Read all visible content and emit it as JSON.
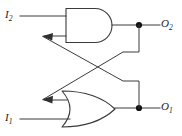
{
  "figure": {
    "width": 182,
    "height": 136,
    "background_color": "#ffffff",
    "line_color": "#3a3a3a",
    "node_color": "#111111"
  },
  "inputs": [
    {
      "id": "i2",
      "label": "I",
      "subscript": "2",
      "position": "top-left",
      "wire_y": 16
    },
    {
      "id": "i1",
      "label": "I",
      "subscript": "1",
      "position": "bottom-left",
      "wire_y": 119
    }
  ],
  "outputs": [
    {
      "id": "o2",
      "label": "O",
      "subscript": "2",
      "position": "top-right",
      "wire_y": 25
    },
    {
      "id": "o1",
      "label": "O",
      "subscript": "1",
      "position": "bottom-right",
      "wire_y": 108
    }
  ],
  "gates": [
    {
      "id": "and-gate",
      "type": "AND",
      "position": "top",
      "input_count": 2,
      "inputs": [
        "I2",
        "O1 feedback"
      ],
      "output": "O2"
    },
    {
      "id": "or-gate",
      "type": "OR",
      "position": "bottom",
      "input_count": 2,
      "inputs": [
        "I1",
        "O2 feedback"
      ],
      "output": "O1"
    }
  ],
  "junctions": [
    {
      "id": "o2-node",
      "x": 139,
      "y": 25
    },
    {
      "id": "o1-node",
      "x": 139,
      "y": 108
    }
  ],
  "feedback_paths": [
    {
      "id": "o2-to-or",
      "from": "o2-node",
      "to": "or-gate-input-2",
      "style": "drop-then-diagonal"
    },
    {
      "id": "o1-to-and",
      "from": "o1-node",
      "to": "and-gate-input-2",
      "style": "rise-then-diagonal"
    }
  ]
}
